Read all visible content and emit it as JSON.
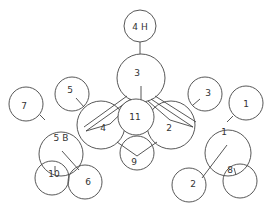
{
  "diagram": {
    "type": "molecular-structure",
    "stroke_color": "#444444",
    "background": "#ffffff",
    "atoms": [
      {
        "id": "a4H",
        "label": "4 H",
        "cx": 140,
        "cy": 26,
        "r": 16
      },
      {
        "id": "a3",
        "label": "3",
        "cx": 141,
        "cy": 78,
        "r": 24
      },
      {
        "id": "a5L",
        "label": "5",
        "cx": 72,
        "cy": 94,
        "r": 17
      },
      {
        "id": "a3R",
        "label": "3",
        "cx": 205,
        "cy": 94,
        "r": 17
      },
      {
        "id": "a7",
        "label": "7",
        "cx": 26,
        "cy": 104,
        "r": 17
      },
      {
        "id": "a1R",
        "label": "1",
        "cx": 246,
        "cy": 103,
        "r": 17
      },
      {
        "id": "a4",
        "label": "4",
        "cx": 101,
        "cy": 125,
        "r": 24
      },
      {
        "id": "a2",
        "label": "2",
        "cx": 171,
        "cy": 125,
        "r": 24
      },
      {
        "id": "a11",
        "label": "11",
        "cx": 136,
        "cy": 117,
        "r": 18
      },
      {
        "id": "a9",
        "label": "9",
        "cx": 137,
        "cy": 153,
        "r": 17
      },
      {
        "id": "a5B",
        "label": "5 B",
        "cx": 61,
        "cy": 154,
        "r": 22
      },
      {
        "id": "a1",
        "label": "1",
        "cx": 228,
        "cy": 153,
        "r": 23
      },
      {
        "id": "a10",
        "label": "10",
        "cx": 52,
        "cy": 178,
        "r": 17
      },
      {
        "id": "a6",
        "label": "6",
        "cx": 85,
        "cy": 182,
        "r": 17
      },
      {
        "id": "a8",
        "label": "8",
        "cx": 240,
        "cy": 181,
        "r": 17
      },
      {
        "id": "a2B",
        "label": "2",
        "cx": 189,
        "cy": 185,
        "r": 17
      }
    ]
  }
}
